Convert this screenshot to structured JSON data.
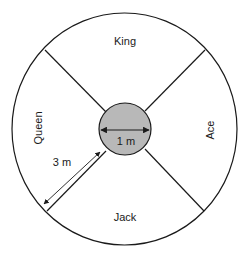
{
  "diagram": {
    "sectors": {
      "top": "King",
      "right": "Ace",
      "bottom": "Jack",
      "left": "Queen"
    },
    "center_label": "1 m",
    "radius_label": "3 m",
    "colors": {
      "stroke": "#1a1a1a",
      "center_fill": "#b8b8b8",
      "background": "#ffffff"
    }
  }
}
